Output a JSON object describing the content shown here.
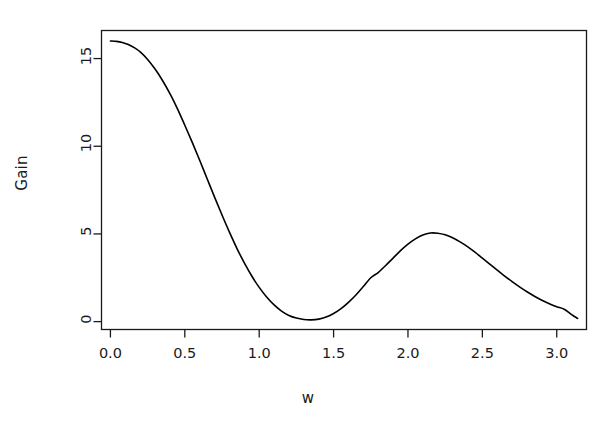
{
  "chart_data": {
    "type": "line",
    "title": "",
    "subtitle": "",
    "xlabel": "w",
    "ylabel": "Gain",
    "xlim": [
      -0.06,
      3.2
    ],
    "ylim": [
      -0.45,
      16.6
    ],
    "xticks": [
      0.0,
      0.5,
      1.0,
      1.5,
      2.0,
      2.5,
      3.0
    ],
    "xtick_labels": [
      "0.0",
      "0.5",
      "1.0",
      "1.5",
      "2.0",
      "2.5",
      "3.0"
    ],
    "yticks": [
      0,
      5,
      10,
      15
    ],
    "ytick_labels": [
      "0",
      "5",
      "10",
      "15"
    ],
    "grid": false,
    "legend": null,
    "box": "full-rectangle",
    "line_color": "#000000",
    "line_width": 1.6,
    "background": "#ffffff",
    "series": [
      {
        "name": "Gain",
        "x": [
          0.0,
          0.04,
          0.08,
          0.12,
          0.16,
          0.2,
          0.25,
          0.3,
          0.35,
          0.4,
          0.45,
          0.5,
          0.55,
          0.6,
          0.65,
          0.7,
          0.75,
          0.8,
          0.85,
          0.9,
          0.95,
          1.0,
          1.05,
          1.1,
          1.15,
          1.2,
          1.25,
          1.3,
          1.35,
          1.4,
          1.45,
          1.5,
          1.55,
          1.6,
          1.65,
          1.7,
          1.75,
          1.8,
          1.85,
          1.9,
          1.95,
          2.0,
          2.05,
          2.1,
          2.15,
          2.2,
          2.25,
          2.3,
          2.35,
          2.4,
          2.45,
          2.5,
          2.55,
          2.6,
          2.65,
          2.7,
          2.75,
          2.8,
          2.85,
          2.9,
          2.95,
          3.0,
          3.05,
          3.1,
          3.14
        ],
        "y": [
          16.0,
          15.98,
          15.92,
          15.8,
          15.62,
          15.38,
          14.95,
          14.4,
          13.75,
          13.0,
          12.15,
          11.2,
          10.22,
          9.2,
          8.15,
          7.1,
          6.08,
          5.1,
          4.18,
          3.35,
          2.6,
          1.95,
          1.4,
          0.95,
          0.6,
          0.35,
          0.2,
          0.12,
          0.1,
          0.14,
          0.26,
          0.46,
          0.74,
          1.1,
          1.52,
          2.0,
          2.5,
          2.8,
          3.2,
          3.62,
          4.05,
          4.42,
          4.72,
          4.94,
          5.05,
          5.04,
          4.95,
          4.78,
          4.55,
          4.28,
          3.96,
          3.62,
          3.28,
          2.94,
          2.6,
          2.28,
          1.98,
          1.7,
          1.45,
          1.22,
          1.02,
          0.85,
          0.7,
          0.4,
          0.18
        ]
      }
    ],
    "annotations": {
      "initial_value": 16.0,
      "first_minimum": {
        "w": 1.35,
        "gain": 0.1
      },
      "secondary_peak": {
        "w": 2.15,
        "gain": 5.05
      },
      "tail_value": 0.15
    }
  },
  "axis_labels": {
    "x": "w",
    "y": "Gain"
  }
}
